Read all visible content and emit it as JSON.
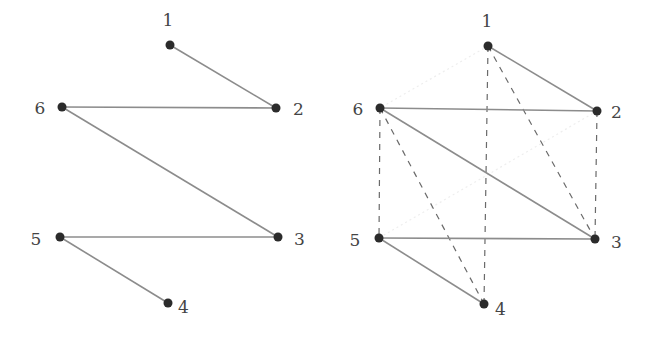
{
  "graphs": [
    {
      "id": "left",
      "nodes": [
        {
          "id": "1",
          "label": "1",
          "x": 170,
          "y": 45,
          "lx": 168,
          "ly": 26,
          "anchor": "middle"
        },
        {
          "id": "2",
          "label": "2",
          "x": 276,
          "y": 108,
          "lx": 293,
          "ly": 115,
          "anchor": "start"
        },
        {
          "id": "3",
          "label": "3",
          "x": 278,
          "y": 237,
          "lx": 294,
          "ly": 245,
          "anchor": "start"
        },
        {
          "id": "4",
          "label": "4",
          "x": 168,
          "y": 303,
          "lx": 178,
          "ly": 313,
          "anchor": "start"
        },
        {
          "id": "5",
          "label": "5",
          "x": 60,
          "y": 237,
          "lx": 36,
          "ly": 245,
          "anchor": "middle"
        },
        {
          "id": "6",
          "label": "6",
          "x": 62,
          "y": 107,
          "lx": 40,
          "ly": 114,
          "anchor": "middle"
        }
      ],
      "edges": [
        {
          "from": "1",
          "to": "2",
          "style": "solid"
        },
        {
          "from": "6",
          "to": "2",
          "style": "solid"
        },
        {
          "from": "6",
          "to": "3",
          "style": "solid"
        },
        {
          "from": "5",
          "to": "3",
          "style": "solid"
        },
        {
          "from": "5",
          "to": "4",
          "style": "solid"
        }
      ]
    },
    {
      "id": "right",
      "nodes": [
        {
          "id": "1",
          "label": "1",
          "x": 488,
          "y": 46,
          "lx": 487,
          "ly": 27,
          "anchor": "middle"
        },
        {
          "id": "2",
          "label": "2",
          "x": 597,
          "y": 111,
          "lx": 611,
          "ly": 118,
          "anchor": "start"
        },
        {
          "id": "3",
          "label": "3",
          "x": 595,
          "y": 239,
          "lx": 611,
          "ly": 248,
          "anchor": "start"
        },
        {
          "id": "4",
          "label": "4",
          "x": 484,
          "y": 304,
          "lx": 495,
          "ly": 315,
          "anchor": "start"
        },
        {
          "id": "5",
          "label": "5",
          "x": 379,
          "y": 238,
          "lx": 355,
          "ly": 246,
          "anchor": "middle"
        },
        {
          "id": "6",
          "label": "6",
          "x": 380,
          "y": 108,
          "lx": 358,
          "ly": 115,
          "anchor": "middle"
        }
      ],
      "edges": [
        {
          "from": "1",
          "to": "6",
          "style": "faint"
        },
        {
          "from": "2",
          "to": "5",
          "style": "faint"
        },
        {
          "from": "1",
          "to": "2",
          "style": "solid"
        },
        {
          "from": "6",
          "to": "2",
          "style": "solid"
        },
        {
          "from": "6",
          "to": "3",
          "style": "solid"
        },
        {
          "from": "5",
          "to": "3",
          "style": "solid"
        },
        {
          "from": "5",
          "to": "4",
          "style": "solid"
        },
        {
          "from": "1",
          "to": "4",
          "style": "dashed"
        },
        {
          "from": "1",
          "to": "3",
          "style": "dashed"
        },
        {
          "from": "6",
          "to": "5",
          "style": "dashed"
        },
        {
          "from": "6",
          "to": "4",
          "style": "dashed"
        },
        {
          "from": "2",
          "to": "3",
          "style": "dashed"
        }
      ]
    }
  ]
}
